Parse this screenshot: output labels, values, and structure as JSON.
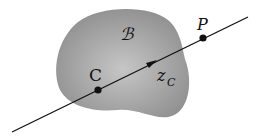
{
  "figure": {
    "body_label": "ℬ",
    "point_C_label": "C",
    "point_P_label": "P",
    "axis_label_main": "z",
    "axis_label_sub": "C",
    "colors": {
      "body_fill_dark": "#8f8f8f",
      "body_fill_light": "#c4c4c4",
      "line": "#111111",
      "background": "#ffffff"
    }
  }
}
